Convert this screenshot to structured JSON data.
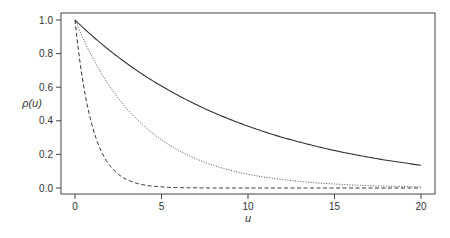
{
  "chart_data": {
    "type": "line",
    "title": "",
    "xlabel": "u",
    "ylabel": "ρ(u)",
    "xlim": [
      0,
      20
    ],
    "ylim": [
      0.0,
      1.0
    ],
    "x_ticks": [
      "0",
      "5",
      "10",
      "15",
      "20"
    ],
    "y_ticks": [
      "0.0",
      "0.2",
      "0.4",
      "0.6",
      "0.8",
      "1.0"
    ],
    "grid": false,
    "legend": null,
    "x": [
      0,
      1,
      2,
      3,
      4,
      5,
      6,
      7,
      8,
      9,
      10,
      11,
      12,
      13,
      14,
      15,
      16,
      17,
      18,
      19,
      20
    ],
    "series": [
      {
        "name": "solid",
        "style": "solid",
        "values": [
          1.0,
          0.905,
          0.819,
          0.741,
          0.67,
          0.607,
          0.549,
          0.497,
          0.449,
          0.407,
          0.368,
          0.333,
          0.301,
          0.273,
          0.247,
          0.223,
          0.202,
          0.183,
          0.165,
          0.15,
          0.135
        ]
      },
      {
        "name": "dotted",
        "style": "dotted",
        "values": [
          1.0,
          0.779,
          0.607,
          0.472,
          0.368,
          0.287,
          0.223,
          0.174,
          0.135,
          0.105,
          0.082,
          0.064,
          0.05,
          0.039,
          0.03,
          0.024,
          0.018,
          0.014,
          0.011,
          0.009,
          0.007
        ]
      },
      {
        "name": "dashed",
        "style": "dashed",
        "values": [
          1.0,
          0.368,
          0.135,
          0.05,
          0.018,
          0.007,
          0.002,
          0.001,
          0.0,
          0.0,
          0.0,
          0.0,
          0.0,
          0.0,
          0.0,
          0.0,
          0.0,
          0.0,
          0.0,
          0.0,
          0.0
        ]
      }
    ]
  }
}
